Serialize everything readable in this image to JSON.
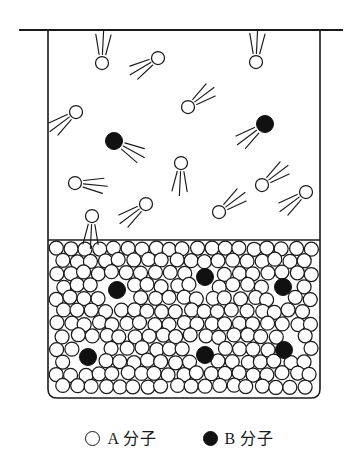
{
  "figure": {
    "colors": {
      "stroke": "#1a1a1a",
      "molecule_a_fill": "#ffffff",
      "molecule_b_fill": "#111111",
      "background": "#ffffff"
    },
    "container": {
      "left": 48,
      "right": 320,
      "top": 30,
      "bottom": 398,
      "corner_radius": 9,
      "lid_line": {
        "x1": 20,
        "x2": 342,
        "y": 30
      },
      "surface_line": {
        "x1": 48,
        "x2": 320,
        "y": 240
      }
    },
    "regions": {
      "gas": {
        "label": "gas phase",
        "top": 30,
        "bottom": 240
      },
      "liquid": {
        "label": "liquid phase",
        "top": 240,
        "bottom": 398
      }
    },
    "molecule_radius": {
      "gas_a": 6.5,
      "gas_b": 8.5,
      "liquid_a": 7.0,
      "liquid_b": 8.5
    },
    "counts": {
      "gas_a": 13,
      "gas_b": 2,
      "liquid_b": 6
    }
  },
  "gas_molecules": [
    {
      "type": "A",
      "x": 102,
      "y": 63,
      "lines": "up"
    },
    {
      "type": "A",
      "x": 158,
      "y": 58,
      "lines": "left-down"
    },
    {
      "type": "A",
      "x": 256,
      "y": 62,
      "lines": "up"
    },
    {
      "type": "A",
      "x": 76,
      "y": 112,
      "lines": "down-left"
    },
    {
      "type": "A",
      "x": 188,
      "y": 107,
      "lines": "up-right"
    },
    {
      "type": "A",
      "x": 181,
      "y": 163,
      "lines": "down"
    },
    {
      "type": "A",
      "x": 75,
      "y": 183,
      "lines": "right"
    },
    {
      "type": "A",
      "x": 262,
      "y": 185,
      "lines": "up-right"
    },
    {
      "type": "A",
      "x": 306,
      "y": 192,
      "lines": "down-left"
    },
    {
      "type": "A",
      "x": 92,
      "y": 216,
      "lines": "down"
    },
    {
      "type": "A",
      "x": 146,
      "y": 204,
      "lines": "down-left"
    },
    {
      "type": "A",
      "x": 219,
      "y": 212,
      "lines": "up-right"
    },
    {
      "type": "B",
      "x": 114,
      "y": 141,
      "lines": "right-down"
    },
    {
      "type": "B",
      "x": 265,
      "y": 124,
      "lines": "down-left"
    }
  ],
  "liquid_molecules_b": [
    {
      "x": 117,
      "y": 290
    },
    {
      "x": 205,
      "y": 277
    },
    {
      "x": 283,
      "y": 287
    },
    {
      "x": 88,
      "y": 357
    },
    {
      "x": 205,
      "y": 355
    },
    {
      "x": 284,
      "y": 350
    }
  ],
  "legend": {
    "items": [
      {
        "swatch": "open-circle",
        "label": "A 分子"
      },
      {
        "swatch": "filled-circle",
        "label": "B 分子"
      }
    ]
  }
}
